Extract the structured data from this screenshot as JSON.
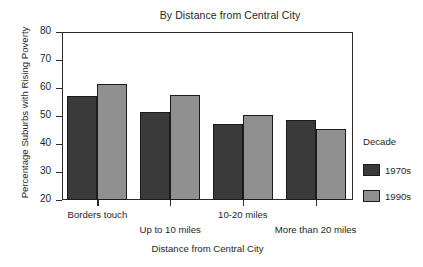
{
  "chart_data": {
    "type": "bar",
    "title": "By Distance from Central City",
    "xlabel": "Distance from Central City",
    "ylabel": "Percentage Suburbs with Rising Poverty",
    "categories": [
      "Borders touch",
      "Up to 10 miles",
      "10-20 miles",
      "More than 20 miles"
    ],
    "series": [
      {
        "name": "1970s",
        "color": "#3a3a3a",
        "values": [
          57.2,
          51.4,
          47.2,
          48.6
        ]
      },
      {
        "name": "1990s",
        "color": "#909090",
        "values": [
          61.6,
          57.4,
          50.4,
          45.2
        ]
      }
    ],
    "ylim": [
      20,
      80
    ],
    "yticks": [
      20,
      30,
      40,
      50,
      60,
      70,
      80
    ],
    "ytick_labels": [
      "20",
      "30",
      "40",
      "50",
      "60",
      "70",
      "80"
    ],
    "grid": false,
    "legend_position": "right",
    "legend_title": "Decade"
  }
}
